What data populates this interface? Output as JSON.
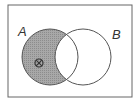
{
  "diagram": {
    "type": "venn",
    "sets": [
      {
        "label": "A"
      },
      {
        "label": "B"
      }
    ],
    "shaded_region": "A only (A minus B)",
    "marker": {
      "symbol": "⊗",
      "region": "A only"
    },
    "colors": {
      "shade": "#9a9a9a",
      "stroke": "#555555",
      "background": "#ffffff"
    }
  }
}
